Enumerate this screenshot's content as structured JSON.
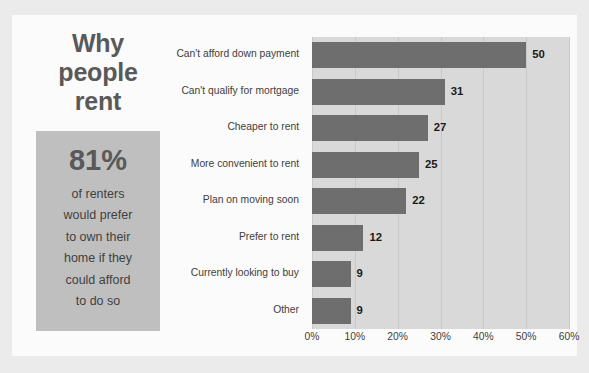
{
  "infographic": {
    "headline_lines": [
      "Why",
      "people",
      "rent"
    ],
    "stat": {
      "number": "81%",
      "caption_lines": [
        "of renters",
        "would prefer",
        "to own their",
        "home if they",
        "could afford",
        "to do so"
      ]
    },
    "colors": {
      "outer_background": "#ebebeb",
      "canvas": "#fbfbfb",
      "stat_box": "#bfbfbf",
      "plot_background": "#d9d9d9",
      "bar": "#6e6e6e",
      "gridline": "#c8c8c8",
      "headline_text": "#595959",
      "label_text": "#404040",
      "value_text": "#1a1a1a"
    }
  },
  "chart_data": {
    "type": "bar",
    "orientation": "horizontal",
    "title": "Why people rent",
    "xlabel": "",
    "ylabel": "",
    "xlim": [
      0,
      60
    ],
    "xticks": [
      0,
      10,
      20,
      30,
      40,
      50,
      60
    ],
    "xtick_labels": [
      "0%",
      "10%",
      "20%",
      "30%",
      "40%",
      "50%",
      "60%"
    ],
    "grid": true,
    "legend": false,
    "value_labels": true,
    "value_label_suffix": "",
    "categories": [
      "Can't afford down payment",
      "Can't qualify for mortgage",
      "Cheaper to rent",
      "More convenient to rent",
      "Plan on moving soon",
      "Prefer to rent",
      "Currently looking to buy",
      "Other"
    ],
    "values": [
      50,
      31,
      27,
      25,
      22,
      12,
      9,
      9
    ],
    "value_label_texts": [
      "50",
      "31",
      "27",
      "25",
      "22",
      "12",
      "9",
      "9"
    ]
  }
}
